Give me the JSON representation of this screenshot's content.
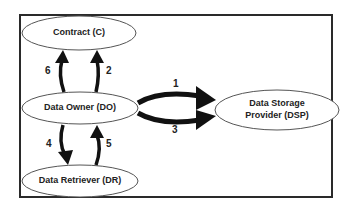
{
  "diagram": {
    "nodes": [
      {
        "id": "C",
        "label": "Contract (C)"
      },
      {
        "id": "DO",
        "label": "Data Owner (DO)"
      },
      {
        "id": "DR",
        "label": "Data Retriever (DR)"
      },
      {
        "id": "DSP",
        "label_line1": "Data Storage",
        "label_line2": "Provider (DSP)"
      }
    ],
    "edges": [
      {
        "step": "1",
        "from": "DO",
        "to": "DSP"
      },
      {
        "step": "2",
        "from": "DO",
        "to": "C"
      },
      {
        "step": "3",
        "from": "DO",
        "to": "DSP"
      },
      {
        "step": "4",
        "from": "DO",
        "to": "DR"
      },
      {
        "step": "5",
        "from": "DR",
        "to": "DO"
      },
      {
        "step": "6",
        "from": "DO",
        "to": "C"
      }
    ]
  }
}
